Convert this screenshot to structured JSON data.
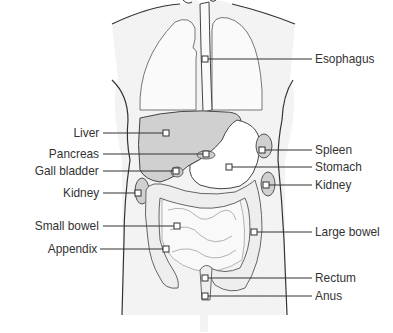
{
  "diagram": {
    "colors": {
      "outline": "#333333",
      "organ_fill": "#cfcfcf",
      "body_fill": "#f4f4f4",
      "text": "#333333"
    },
    "labels_left": [
      {
        "id": "liver",
        "text": "Liver",
        "y": 133,
        "marker_x": 166
      },
      {
        "id": "pancreas",
        "text": "Pancreas",
        "y": 154,
        "marker_x": 206
      },
      {
        "id": "gall-bladder",
        "text": "Gall bladder",
        "y": 171,
        "marker_x": 176
      },
      {
        "id": "kidney-left",
        "text": "Kidney",
        "y": 193,
        "marker_x": 138
      },
      {
        "id": "small-bowel",
        "text": "Small bowel",
        "y": 226,
        "marker_x": 177
      },
      {
        "id": "appendix",
        "text": "Appendix",
        "y": 249,
        "marker_x": 166
      }
    ],
    "labels_right": [
      {
        "id": "esophagus",
        "text": "Esophagus",
        "y": 59,
        "marker_x": 205
      },
      {
        "id": "spleen",
        "text": "Spleen",
        "y": 150,
        "marker_x": 262
      },
      {
        "id": "stomach",
        "text": "Stomach",
        "y": 167,
        "marker_x": 229
      },
      {
        "id": "kidney-right",
        "text": "Kidney",
        "y": 185,
        "marker_x": 266
      },
      {
        "id": "large-bowel",
        "text": "Large bowel",
        "y": 232,
        "marker_x": 254
      },
      {
        "id": "rectum",
        "text": "Rectum",
        "y": 278,
        "marker_x": 205
      },
      {
        "id": "anus",
        "text": "Anus",
        "y": 296,
        "marker_x": 205
      }
    ]
  }
}
